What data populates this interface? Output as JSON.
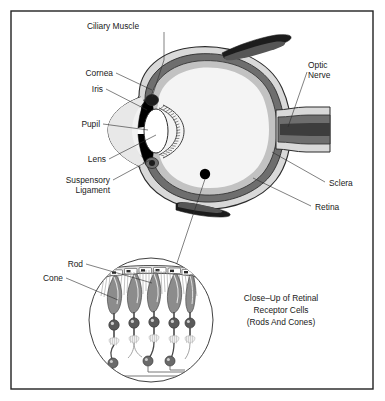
{
  "figure": {
    "background_color": "#ffffff",
    "border_color": "#222222"
  },
  "labels": {
    "ciliary_muscle": "Ciliary Muscle",
    "cornea": "Cornea",
    "iris": "Iris",
    "pupil": "Pupil",
    "lens": "Lens",
    "suspensory_ligament_line1": "Suspensory",
    "suspensory_ligament_line2": "Ligament",
    "optic_nerve_line1": "Optic",
    "optic_nerve_line2": "Nerve",
    "sclera": "Sclera",
    "retina": "Retina",
    "rod": "Rod",
    "cone": "Cone"
  },
  "caption": {
    "line1": "Close–Up of Retinal",
    "line2": "Receptor Cells",
    "line3": "(Rods And Cones)"
  },
  "colors": {
    "outline": "#2b2b2b",
    "sclera_fill": "#d9d9d9",
    "choroid_fill": "#6e6e6e",
    "retina_fill": "#c2c2c2",
    "vitreous_fill": "#f4f4f4",
    "iris_fill": "#000000",
    "lens_fill": "#ffffff",
    "muscle_fill": "#1c1c1c",
    "cell_fill": "#8c8c8c",
    "nucleus_fill": "#5a5a5a"
  },
  "closeup": {
    "receptor_columns": 5,
    "ganglion_cells": 3,
    "epithelium_cells": 6
  }
}
